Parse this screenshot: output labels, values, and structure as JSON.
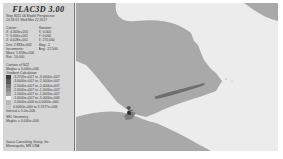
{
  "header": {
    "title": "FLAC3D 3.00",
    "step_line": "Step 8011 06  Model Perspective",
    "date_line": "20:18:01 Wed Mar 22 2017"
  },
  "view": {
    "center_label": "Center:",
    "rotation_label": "Rotation:",
    "center": [
      "X: 4.303e+001",
      "Y: 5.000e+001",
      "Z: 4.028e+001"
    ],
    "rotation": [
      "X:   0.000",
      "Y:   0.000",
      "Z: 270.000"
    ],
    "dist": "Dist: 2.883e+002",
    "mag": "Mag.:    1",
    "increments_label": "Increments:",
    "ang": "Ang.: 22.500",
    "move": "Move: 5.658e+000",
    "rot": "Rot.:   10.000"
  },
  "contour": {
    "heading": "Contour of SZZ",
    "magfac": "Magfac = 0.000e+000",
    "gradient_label": "Gradient Calculation",
    "levels": [
      {
        "label": "-3.2705e+007 to -3.0000e+007",
        "color": "#3c3c3c"
      },
      {
        "label": "-3.0000e+007 to -2.5000e+007",
        "color": "#5e5e5e"
      },
      {
        "label": "-2.5000e+007 to -2.0000e+007",
        "color": "#7a7a7a"
      },
      {
        "label": "-2.0000e+007 to -1.5000e+007",
        "color": "#8e8e8e"
      },
      {
        "label": "-1.5000e+007 to -1.0000e+007",
        "color": "#a4a4a4"
      },
      {
        "label": "-1.0000e+007 to -5.0000e+006",
        "color": "#f2f2f2"
      },
      {
        "label": "-5.0000e+006 to  0.0000e+000",
        "color": "#b8b8b8"
      },
      {
        "label": " 0.0000e+000 to  3.2377e+006",
        "color": "#c8c8c8"
      }
    ],
    "interval": "Interval = 5.0e+006"
  },
  "displacement": {
    "heading": "SEL Geometry",
    "magfac": "Magfac = 0.000e+000"
  },
  "footer": {
    "company": "Itasca Consulting Group, Inc.",
    "location": "Minneapolis, MN  USA"
  },
  "plot_colors": {
    "background": "#ececec",
    "region_mid": "#a9a9a9",
    "region_light": "#e8e8e8",
    "band_dark": "#6e6e6e"
  }
}
